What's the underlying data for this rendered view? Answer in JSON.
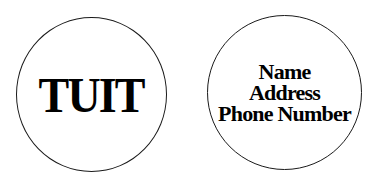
{
  "left_circle": {
    "text": "TUIT"
  },
  "right_circle": {
    "lines": [
      "Name",
      "Address",
      "Phone Number"
    ]
  },
  "colors": {
    "background": "#ffffff",
    "stroke": "#1a1a1a",
    "text": "#000000"
  }
}
